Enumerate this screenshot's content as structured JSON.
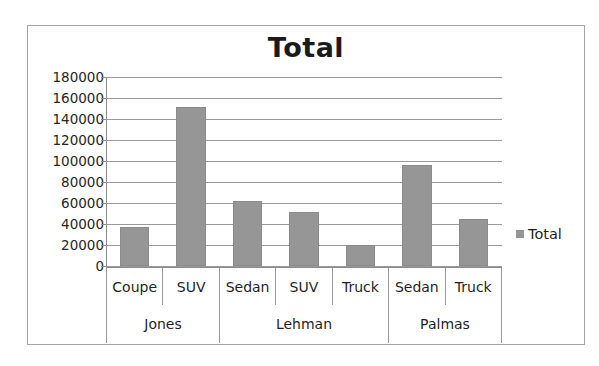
{
  "chart_data": {
    "type": "bar",
    "title": "Total",
    "xlabel": "",
    "ylabel": "",
    "ylim": [
      0,
      180000
    ],
    "ytick_step": 20000,
    "yticks": [
      "180000",
      "160000",
      "140000",
      "120000",
      "100000",
      "80000",
      "60000",
      "40000",
      "20000",
      "0"
    ],
    "grid": true,
    "legend_position": "right",
    "legend": [
      "Total"
    ],
    "series": [
      {
        "name": "Total",
        "values": [
          37000,
          151000,
          62000,
          51000,
          20000,
          96000,
          45000
        ],
        "color": "#969696"
      }
    ],
    "categories": [
      "Coupe",
      "SUV",
      "Sedan",
      "SUV",
      "Truck",
      "Sedan",
      "Truck"
    ],
    "groups": [
      {
        "label": "Jones",
        "span": 2
      },
      {
        "label": "Lehman",
        "span": 3
      },
      {
        "label": "Palmas",
        "span": 2
      }
    ]
  },
  "legend": {
    "swatch_color": "#969696",
    "entry_label": "Total"
  }
}
